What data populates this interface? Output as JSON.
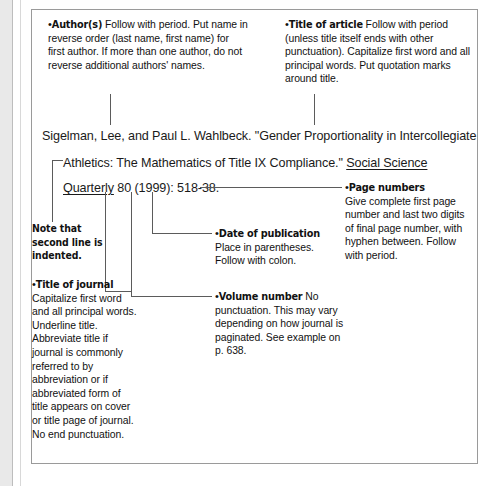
{
  "figure": {
    "bullet_glyph": "•"
  },
  "citation": {
    "lines": [
      {
        "id": "line1",
        "segments": [
          {
            "text": "Sigelman, Lee, and Paul L. Wahlbeck. \"Gender Proportionality in Intercollegiate",
            "underline": false
          }
        ]
      },
      {
        "id": "line2",
        "segments": [
          {
            "text": "Athletics: The Mathematics of Title IX Compliance.\" ",
            "underline": false
          },
          {
            "text": "Social Science",
            "underline": true
          }
        ]
      },
      {
        "id": "line3",
        "segments": [
          {
            "text": "Quarterly",
            "underline": true
          },
          {
            "text": " 80 (1999): 518-38.",
            "underline": false
          }
        ]
      }
    ]
  },
  "callouts": {
    "authors": {
      "head": "Author(s)",
      "body": " Follow with period. Put name in reverse order (last name, first name) for first author. If more than one author, do not reverse additional authors' names."
    },
    "title_of_article": {
      "head": "Title of article",
      "body": " Follow with period (unless title itself ends with other punctuation). Capitalize first word and all principal words. Put quotation marks around title."
    },
    "page_numbers": {
      "head": "Page numbers",
      "body": "Give complete first page number and last two digits of final page number, with hyphen between. Follow with period."
    },
    "date_of_publication": {
      "head": "Date of publication",
      "body": "Place in parentheses. Follow with colon."
    },
    "volume_number": {
      "head": "Volume number",
      "body": " No punctuation. This may vary depending on how journal is paginated. See example on p. 638."
    },
    "title_of_journal": {
      "head": "Title of journal",
      "body": "Capitalize first word and all principal words. Underline title. Abbreviate title if journal is commonly referred to by abbreviation or if abbreviated form of title appears on cover or title page of journal. No end punctuation."
    },
    "indent_note": {
      "text": "Note that second line is indented."
    }
  },
  "colors": {
    "text": "#111111",
    "leader_line": "#5b5b5b",
    "frame_border": "#9a9a9a",
    "gutter": "#e9e9e9",
    "page_background": "#ffffff"
  }
}
